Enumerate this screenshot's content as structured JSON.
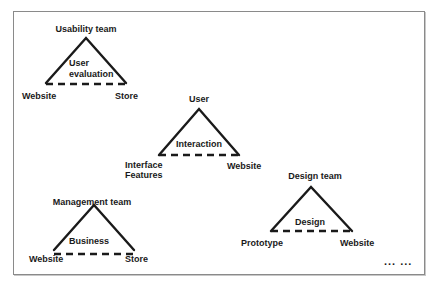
{
  "diagram": {
    "type": "triangle-relationship-diagram",
    "line_color": "#1a1a1a",
    "triangles": [
      {
        "id": "usability",
        "apex": "Usability team",
        "center": [
          "User",
          "evaluation"
        ],
        "left": "Website",
        "right": "Store"
      },
      {
        "id": "user",
        "apex": "User",
        "center": [
          "Interaction"
        ],
        "left": [
          "Interface",
          "Features"
        ],
        "right": "Website"
      },
      {
        "id": "management",
        "apex": "Management team",
        "center": [
          "Business"
        ],
        "left": "Website",
        "right": "Store"
      },
      {
        "id": "design",
        "apex": "Design team",
        "center": [
          "Design"
        ],
        "left": "Prototype",
        "right": "Website"
      }
    ],
    "continuation": "... ..."
  }
}
